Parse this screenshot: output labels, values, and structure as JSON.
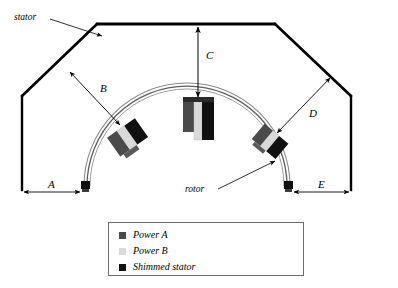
{
  "figure": {
    "background_color": "#ffffff",
    "line_color": "#000000",
    "clipped_header_text": "",
    "labels": {
      "stator": "stator",
      "rotor": "rotor",
      "dim_a": "A",
      "dim_b": "B",
      "dim_c": "C",
      "dim_d": "D",
      "dim_e": "E"
    }
  },
  "legend": {
    "border_color": "#6d6d6d",
    "items": [
      {
        "label": "Power A",
        "color": "#4a4a4a"
      },
      {
        "label": "Power B",
        "color": "#d9d9d9"
      },
      {
        "label": "Shimmed stator",
        "color": "#111111"
      }
    ]
  },
  "assemblies": [
    {
      "name": "left-shim-assembly",
      "angle_deg": -35
    },
    {
      "name": "center-shim-assembly",
      "angle_deg": 0
    },
    {
      "name": "right-shim-assembly",
      "angle_deg": 40
    }
  ],
  "colors": {
    "power_a": "#4a4a4a",
    "power_b": "#d9d9d9",
    "shimmed_stator": "#111111",
    "rotor_arc": "#6f6f6f",
    "stator_outline": "#000000",
    "dimension_line": "#3a3a3a"
  }
}
